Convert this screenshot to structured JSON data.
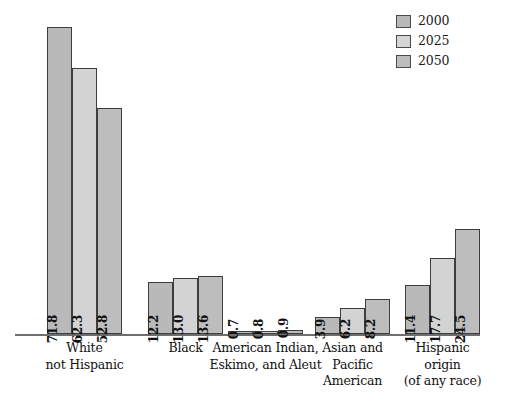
{
  "chart_data": {
    "type": "bar",
    "title": "",
    "subtitle": "",
    "xlabel": "",
    "ylabel": "",
    "ylim": [
      0,
      80
    ],
    "grid": false,
    "legend_position": "top-right",
    "categories": [
      "White\nnot Hispanic",
      "Black",
      "American Indian,\nEskimo, and Aleut",
      "Asian and\nPacific\nAmerican",
      "Hispanic\norigin\n(of any race)"
    ],
    "series": [
      {
        "name": "2000",
        "values": [
          71.8,
          12.2,
          0.7,
          3.9,
          11.4
        ],
        "color": "#b9b9b9"
      },
      {
        "name": "2025",
        "values": [
          62.3,
          13.0,
          0.8,
          6.2,
          17.7
        ],
        "color": "#d3d3d3"
      },
      {
        "name": "2050",
        "values": [
          52.8,
          13.6,
          0.9,
          8.2,
          24.5
        ],
        "color": "#bdbdbd"
      }
    ]
  },
  "legend": {
    "items": [
      {
        "label": "2000",
        "color": "#b9b9b9"
      },
      {
        "label": "2025",
        "color": "#d5d5d5"
      },
      {
        "label": "2050",
        "color": "#bdbdbd"
      }
    ]
  },
  "groups": [
    {
      "label_lines": [
        "White",
        "not Hispanic"
      ],
      "bars": [
        {
          "series": "2000",
          "value": "71.8"
        },
        {
          "series": "2025",
          "value": "62.3"
        },
        {
          "series": "2050",
          "value": "52.8"
        }
      ]
    },
    {
      "label_lines": [
        "Black"
      ],
      "bars": [
        {
          "series": "2000",
          "value": "12.2"
        },
        {
          "series": "2025",
          "value": "13.0"
        },
        {
          "series": "2050",
          "value": "13.6"
        }
      ]
    },
    {
      "label_lines": [
        "American Indian,",
        "Eskimo, and Aleut"
      ],
      "bars": [
        {
          "series": "2000",
          "value": "0.7"
        },
        {
          "series": "2025",
          "value": "0.8"
        },
        {
          "series": "2050",
          "value": "0.9"
        }
      ]
    },
    {
      "label_lines": [
        "Asian and",
        "Pacific",
        "American"
      ],
      "bars": [
        {
          "series": "2000",
          "value": "3.9"
        },
        {
          "series": "2025",
          "value": "6.2"
        },
        {
          "series": "2050",
          "value": "8.2"
        }
      ]
    },
    {
      "label_lines": [
        "Hispanic",
        "origin",
        "(of any race)"
      ],
      "bars": [
        {
          "series": "2000",
          "value": "11.4"
        },
        {
          "series": "2025",
          "value": "17.7"
        },
        {
          "series": "2050",
          "value": "24.5"
        }
      ]
    }
  ]
}
